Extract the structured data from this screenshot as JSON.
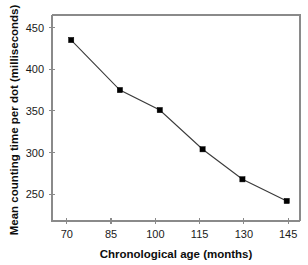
{
  "chart_data": {
    "type": "line",
    "title": "",
    "xlabel": "Chronological age (months)",
    "ylabel": "Mean counting time per dot (milliseconds)",
    "x": [
      71.5,
      88,
      101.5,
      116,
      129.5,
      144.5
    ],
    "values": [
      435,
      375,
      351,
      304,
      268,
      242
    ],
    "series": [
      {
        "name": "Mean counting time per dot",
        "x": [
          71.5,
          88,
          101.5,
          116,
          129.5,
          144.5
        ],
        "values": [
          435,
          375,
          351,
          304,
          268,
          242
        ]
      }
    ],
    "xlim": [
      65,
      149
    ],
    "ylim": [
      218,
      465
    ],
    "xticks": [
      70,
      85,
      100,
      115,
      130,
      145
    ],
    "yticks": [
      250,
      300,
      350,
      400,
      450
    ],
    "xtick_labels": [
      "70",
      "85",
      "100",
      "115",
      "130",
      "145"
    ],
    "ytick_labels": [
      "250",
      "300",
      "350",
      "400",
      "450"
    ],
    "grid": false,
    "legend": false,
    "marker": "filled-square",
    "line_color": "#3a3a3a",
    "marker_color": "#000000",
    "frame_color": "#8a8a8a",
    "background_color": "#ffffff"
  }
}
